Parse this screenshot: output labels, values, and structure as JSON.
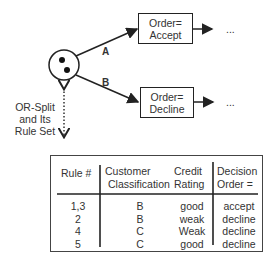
{
  "diagram": {
    "split_node": {
      "type": "OR-Split",
      "label_lines": [
        "OR-Split",
        "and Its",
        "Rule Set"
      ]
    },
    "branches": [
      {
        "label": "A",
        "target": {
          "lines": [
            "Order=",
            "Accept"
          ]
        },
        "continuation": "..."
      },
      {
        "label": "B",
        "target": {
          "lines": [
            "Order=",
            "Decline"
          ]
        },
        "continuation": "..."
      }
    ]
  },
  "rule_table": {
    "headers": [
      {
        "lines": [
          "Rule #"
        ]
      },
      {
        "lines": [
          "Customer",
          "Classification"
        ]
      },
      {
        "lines": [
          "Credit",
          "Rating"
        ]
      },
      {
        "lines": [
          "Decision",
          "Order ="
        ]
      }
    ],
    "rows": [
      {
        "rule": "1,3",
        "classification": "B",
        "rating": "good",
        "decision": "accept"
      },
      {
        "rule": "2",
        "classification": "B",
        "rating": "weak",
        "decision": "decline"
      },
      {
        "rule": "4",
        "classification": "C",
        "rating": "Weak",
        "decision": "decline"
      },
      {
        "rule": "5",
        "classification": "C",
        "rating": "good",
        "decision": "decline"
      }
    ]
  }
}
